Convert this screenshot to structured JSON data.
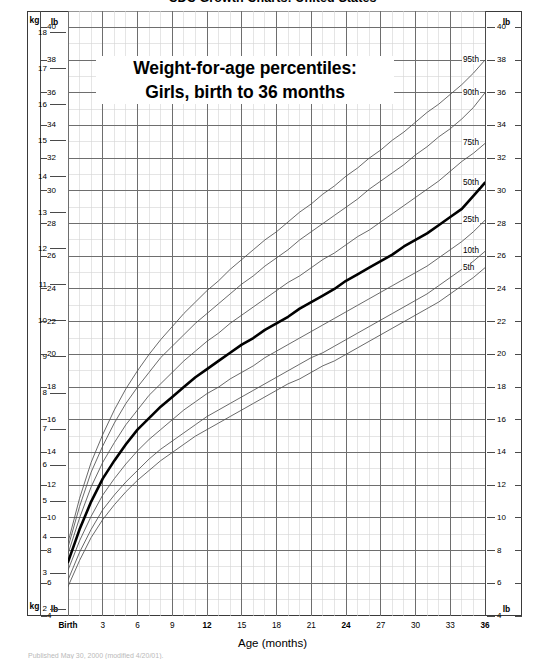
{
  "page": {
    "title": "CDC Growth Charts: United States",
    "footnote": "Published May 30, 2000 (modified 4/20/01)."
  },
  "annotation": {
    "line1": "Weight-for-age percentiles:",
    "line2": "Girls, birth to 36 months"
  },
  "axes": {
    "x_title": "Age (months)",
    "unit_kg": "kg",
    "unit_lb": "lb",
    "x_ticks": [
      {
        "label": "Birth",
        "value": 0,
        "bold": true
      },
      {
        "label": "3",
        "value": 3,
        "bold": false
      },
      {
        "label": "6",
        "value": 6,
        "bold": false
      },
      {
        "label": "9",
        "value": 9,
        "bold": false
      },
      {
        "label": "12",
        "value": 12,
        "bold": true
      },
      {
        "label": "15",
        "value": 15,
        "bold": false
      },
      {
        "label": "18",
        "value": 18,
        "bold": false
      },
      {
        "label": "21",
        "value": 21,
        "bold": false
      },
      {
        "label": "24",
        "value": 24,
        "bold": true
      },
      {
        "label": "27",
        "value": 27,
        "bold": false
      },
      {
        "label": "30",
        "value": 30,
        "bold": false
      },
      {
        "label": "33",
        "value": 33,
        "bold": false
      },
      {
        "label": "36",
        "value": 36,
        "bold": true
      }
    ],
    "kg_ticks": [
      2,
      3,
      4,
      5,
      6,
      7,
      8,
      9,
      10,
      11,
      12,
      13,
      14,
      15,
      16,
      17,
      18
    ],
    "lb_ticks": [
      4,
      6,
      8,
      10,
      12,
      14,
      16,
      18,
      20,
      22,
      24,
      26,
      28,
      30,
      32,
      34,
      36,
      38,
      40
    ]
  },
  "curve_labels": [
    {
      "label": "95th",
      "lb": 38.0
    },
    {
      "label": "90th",
      "lb": 36.0
    },
    {
      "label": "75th",
      "lb": 32.9
    },
    {
      "label": "50th",
      "lb": 30.5
    },
    {
      "label": "25th",
      "lb": 28.2
    },
    {
      "label": "10th",
      "lb": 26.3
    },
    {
      "label": "5th",
      "lb": 25.3
    }
  ],
  "colors": {
    "grid_major": "#6e6e6e",
    "grid_minor": "#d4d4d4",
    "curve": "#4f4f4f",
    "curve_median": "#000000",
    "frame": "#3a3a3a",
    "background": "#ffffff"
  },
  "chart_data": {
    "type": "line",
    "xlabel": "Age (months)",
    "ylabel": "Weight",
    "y_unit_primary": "lb",
    "y_unit_secondary": "kg",
    "xlim": [
      0,
      36
    ],
    "ylim_lb": [
      4,
      41
    ],
    "ylim_kg": [
      1.8,
      18.6
    ],
    "grid": true,
    "legend": "inline-right-labels",
    "x": [
      0,
      1,
      2,
      3,
      4,
      5,
      6,
      7,
      8,
      9,
      10,
      11,
      12,
      13,
      14,
      15,
      16,
      17,
      18,
      19,
      20,
      21,
      22,
      23,
      24,
      25,
      26,
      27,
      28,
      29,
      30,
      31,
      32,
      33,
      34,
      35,
      36
    ],
    "series": [
      {
        "name": "95th",
        "unit": "lb",
        "values": [
          8.5,
          11.2,
          13.4,
          15.1,
          16.6,
          17.9,
          19.0,
          20.0,
          20.9,
          21.7,
          22.5,
          23.2,
          23.9,
          24.5,
          25.2,
          25.8,
          26.4,
          27.0,
          27.5,
          28.1,
          28.7,
          29.2,
          29.8,
          30.3,
          30.9,
          31.4,
          32.0,
          32.5,
          33.1,
          33.6,
          34.2,
          34.8,
          35.3,
          35.9,
          36.5,
          37.2,
          38.0
        ]
      },
      {
        "name": "90th",
        "unit": "lb",
        "values": [
          8.2,
          10.7,
          12.8,
          14.4,
          15.8,
          17.0,
          18.0,
          18.9,
          19.8,
          20.5,
          21.2,
          21.9,
          22.5,
          23.1,
          23.7,
          24.3,
          24.8,
          25.4,
          25.9,
          26.4,
          27.0,
          27.5,
          28.0,
          28.5,
          29.0,
          29.5,
          30.1,
          30.6,
          31.1,
          31.6,
          32.2,
          32.7,
          33.3,
          33.8,
          34.4,
          35.1,
          36.0
        ]
      },
      {
        "name": "75th",
        "unit": "lb",
        "values": [
          7.8,
          10.0,
          11.9,
          13.4,
          14.6,
          15.7,
          16.6,
          17.5,
          18.2,
          18.9,
          19.6,
          20.2,
          20.8,
          21.3,
          21.9,
          22.4,
          22.9,
          23.4,
          23.9,
          24.4,
          24.8,
          25.3,
          25.8,
          26.2,
          26.7,
          27.2,
          27.6,
          28.1,
          28.6,
          29.1,
          29.6,
          30.1,
          30.6,
          31.2,
          31.8,
          32.3,
          32.9
        ]
      },
      {
        "name": "50th",
        "unit": "lb",
        "values": [
          7.3,
          9.3,
          11.0,
          12.4,
          13.5,
          14.5,
          15.4,
          16.1,
          16.8,
          17.4,
          18.0,
          18.6,
          19.1,
          19.6,
          20.1,
          20.6,
          21.0,
          21.5,
          21.9,
          22.3,
          22.8,
          23.2,
          23.6,
          24.0,
          24.5,
          24.9,
          25.3,
          25.7,
          26.1,
          26.6,
          27.0,
          27.4,
          27.9,
          28.4,
          28.9,
          29.7,
          30.5
        ]
      },
      {
        "name": "25th",
        "unit": "lb",
        "values": [
          6.8,
          8.6,
          10.1,
          11.4,
          12.4,
          13.3,
          14.1,
          14.8,
          15.4,
          16.0,
          16.6,
          17.1,
          17.6,
          18.0,
          18.5,
          18.9,
          19.3,
          19.8,
          20.2,
          20.6,
          21.0,
          21.4,
          21.8,
          22.2,
          22.6,
          23.0,
          23.4,
          23.8,
          24.2,
          24.6,
          25.0,
          25.4,
          25.9,
          26.4,
          26.9,
          27.5,
          28.2
        ]
      },
      {
        "name": "10th",
        "unit": "lb",
        "values": [
          6.2,
          7.9,
          9.3,
          10.5,
          11.4,
          12.2,
          12.9,
          13.6,
          14.2,
          14.7,
          15.2,
          15.7,
          16.2,
          16.6,
          17.0,
          17.4,
          17.8,
          18.2,
          18.6,
          19.0,
          19.4,
          19.8,
          20.1,
          20.5,
          20.9,
          21.3,
          21.7,
          22.1,
          22.5,
          22.9,
          23.3,
          23.7,
          24.2,
          24.7,
          25.2,
          25.7,
          26.3
        ]
      },
      {
        "name": "5th",
        "unit": "lb",
        "values": [
          5.8,
          7.4,
          8.8,
          9.9,
          10.8,
          11.6,
          12.3,
          12.9,
          13.5,
          14.0,
          14.5,
          15.0,
          15.4,
          15.8,
          16.2,
          16.6,
          17.0,
          17.4,
          17.8,
          18.2,
          18.5,
          18.9,
          19.3,
          19.6,
          20.0,
          20.4,
          20.8,
          21.2,
          21.6,
          22.0,
          22.4,
          22.8,
          23.2,
          23.7,
          24.2,
          24.7,
          25.3
        ]
      }
    ]
  }
}
